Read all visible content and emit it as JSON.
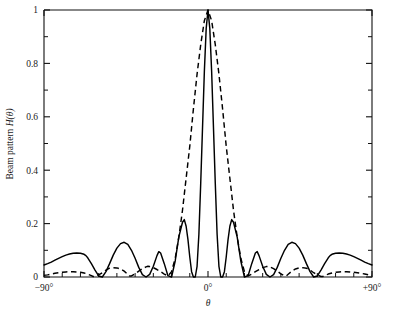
{
  "chart_data": {
    "type": "line",
    "title": "",
    "xlabel": "θ",
    "ylabel": "Beam pattern H(θ)",
    "ylabel_prefix": "Beam pattern ",
    "ylabel_func": "H",
    "ylabel_arg": "(θ)",
    "xlim": [
      -90,
      90
    ],
    "ylim": [
      0,
      1
    ],
    "grid": false,
    "legend": "none",
    "x_tick_labels": [
      "−90°",
      "0°",
      "+90°"
    ],
    "x_tick_values": [
      -90,
      0,
      90
    ],
    "x_minor_tick_values": [
      -80,
      -70,
      -60,
      -50,
      -40,
      -30,
      -20,
      -10,
      10,
      20,
      30,
      40,
      50,
      60,
      70,
      80
    ],
    "y_tick_labels": [
      "0",
      "0.2",
      "0.4",
      "0.6",
      "0.8",
      "1"
    ],
    "y_tick_values": [
      0,
      0.2,
      0.4,
      0.6,
      0.8,
      1
    ],
    "y_minor_tick_values": [
      0.1,
      0.3,
      0.5,
      0.7,
      0.9
    ],
    "series": [
      {
        "name": "solid-beam-pattern",
        "style": "solid",
        "color": "#000000",
        "main_lobe_peak": 1.0,
        "main_lobe_peak_angle": 0,
        "main_lobe_null_angles": [
          -13,
          13
        ],
        "sidelobe_peaks": [
          {
            "angle": -20,
            "value": 0.215
          },
          {
            "angle": -36,
            "value": 0.13
          },
          {
            "angle": -58,
            "value": 0.09
          },
          {
            "angle": -90,
            "value": 0.045
          },
          {
            "angle": 20,
            "value": 0.215
          },
          {
            "angle": 36,
            "value": 0.13
          },
          {
            "angle": 58,
            "value": 0.09
          },
          {
            "angle": 90,
            "value": 0.045
          }
        ],
        "null_angles": [
          -67,
          -46,
          -27,
          -13,
          13,
          27,
          46,
          67
        ],
        "x": [
          -90,
          -88,
          -86,
          -84,
          -82,
          -80,
          -78,
          -76,
          -74,
          -72,
          -70,
          -68,
          -67,
          -66,
          -64,
          -62,
          -60,
          -58,
          -56,
          -54,
          -52,
          -50,
          -48,
          -46,
          -44,
          -42,
          -40,
          -38,
          -36,
          -34,
          -32,
          -30,
          -28,
          -27,
          -26,
          -24,
          -22,
          -20,
          -18,
          -16,
          -14,
          -13,
          -12,
          -11,
          -10,
          -9,
          -8,
          -7,
          -6,
          -5,
          -4,
          -3,
          -2,
          -1,
          0,
          1,
          2,
          3,
          4,
          5,
          6,
          7,
          8,
          9,
          10,
          11,
          12,
          13,
          14,
          16,
          18,
          20,
          22,
          24,
          26,
          27,
          28,
          30,
          32,
          34,
          36,
          38,
          40,
          42,
          44,
          46,
          48,
          50,
          52,
          54,
          56,
          58,
          60,
          62,
          64,
          66,
          67,
          68,
          70,
          72,
          74,
          76,
          78,
          80,
          82,
          84,
          86,
          88,
          90
        ],
        "y": [
          0.045,
          0.05,
          0.056,
          0.063,
          0.07,
          0.076,
          0.082,
          0.086,
          0.089,
          0.09,
          0.089,
          0.085,
          0.08,
          0.072,
          0.05,
          0.026,
          0.004,
          0.0,
          0.02,
          0.05,
          0.082,
          0.108,
          0.125,
          0.13,
          0.122,
          0.1,
          0.07,
          0.036,
          0.009,
          0.0,
          0.01,
          0.04,
          0.08,
          0.095,
          0.09,
          0.05,
          0.005,
          0.0,
          0.06,
          0.15,
          0.205,
          0.215,
          0.19,
          0.14,
          0.075,
          0.02,
          0.0,
          0.0,
          0.04,
          0.16,
          0.35,
          0.56,
          0.77,
          0.93,
          1.0,
          0.93,
          0.77,
          0.56,
          0.35,
          0.16,
          0.04,
          0.0,
          0.0,
          0.02,
          0.075,
          0.14,
          0.19,
          0.215,
          0.205,
          0.15,
          0.06,
          0.0,
          0.005,
          0.05,
          0.09,
          0.095,
          0.08,
          0.04,
          0.01,
          0.0,
          0.009,
          0.036,
          0.07,
          0.1,
          0.122,
          0.13,
          0.125,
          0.108,
          0.082,
          0.05,
          0.02,
          0.0,
          0.004,
          0.026,
          0.05,
          0.072,
          0.08,
          0.085,
          0.089,
          0.09,
          0.089,
          0.086,
          0.082,
          0.076,
          0.07,
          0.063,
          0.056,
          0.05,
          0.045
        ]
      },
      {
        "name": "dashed-beam-pattern",
        "style": "dashed",
        "color": "#000000",
        "main_lobe_peak": 1.0,
        "main_lobe_peak_angle": 0,
        "main_lobe_null_angles": [
          -22,
          22
        ],
        "sidelobe_peaks": [
          {
            "angle": -33,
            "value": 0.04
          },
          {
            "angle": -52,
            "value": 0.035
          },
          {
            "angle": -75,
            "value": 0.02
          },
          {
            "angle": 33,
            "value": 0.04
          },
          {
            "angle": 52,
            "value": 0.035
          },
          {
            "angle": 75,
            "value": 0.02
          }
        ],
        "null_angles": [
          -63,
          -43,
          -22,
          22,
          43,
          63
        ],
        "x": [
          -90,
          -88,
          -86,
          -84,
          -82,
          -80,
          -78,
          -76,
          -74,
          -72,
          -70,
          -68,
          -66,
          -64,
          -63,
          -62,
          -60,
          -58,
          -56,
          -54,
          -52,
          -50,
          -48,
          -46,
          -44,
          -43,
          -42,
          -40,
          -38,
          -36,
          -34,
          -33,
          -32,
          -30,
          -28,
          -26,
          -24,
          -22,
          -20,
          -18,
          -16,
          -14,
          -12,
          -10,
          -8,
          -6,
          -4,
          -2,
          0,
          2,
          4,
          6,
          8,
          10,
          12,
          14,
          16,
          18,
          20,
          22,
          24,
          26,
          28,
          30,
          32,
          33,
          34,
          36,
          38,
          40,
          42,
          43,
          44,
          46,
          48,
          50,
          52,
          54,
          56,
          58,
          60,
          62,
          63,
          64,
          66,
          68,
          70,
          72,
          74,
          76,
          78,
          80,
          82,
          84,
          86,
          88,
          90
        ],
        "y": [
          0.006,
          0.008,
          0.011,
          0.014,
          0.016,
          0.018,
          0.019,
          0.02,
          0.02,
          0.019,
          0.018,
          0.015,
          0.011,
          0.005,
          0.002,
          0.002,
          0.008,
          0.016,
          0.026,
          0.033,
          0.035,
          0.034,
          0.03,
          0.022,
          0.01,
          0.004,
          0.004,
          0.012,
          0.022,
          0.031,
          0.038,
          0.04,
          0.039,
          0.035,
          0.028,
          0.02,
          0.011,
          0.004,
          0.02,
          0.07,
          0.15,
          0.25,
          0.37,
          0.49,
          0.63,
          0.76,
          0.87,
          0.96,
          1.0,
          0.96,
          0.87,
          0.76,
          0.63,
          0.49,
          0.37,
          0.25,
          0.15,
          0.07,
          0.02,
          0.004,
          0.011,
          0.02,
          0.028,
          0.035,
          0.039,
          0.04,
          0.038,
          0.031,
          0.022,
          0.012,
          0.004,
          0.004,
          0.01,
          0.022,
          0.03,
          0.034,
          0.035,
          0.033,
          0.026,
          0.016,
          0.008,
          0.002,
          0.002,
          0.005,
          0.011,
          0.015,
          0.018,
          0.019,
          0.02,
          0.02,
          0.019,
          0.018,
          0.016,
          0.014,
          0.011,
          0.008,
          0.006
        ]
      }
    ]
  }
}
